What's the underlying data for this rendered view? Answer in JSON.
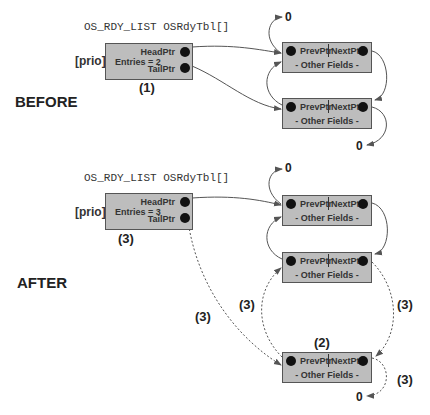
{
  "before": {
    "stage_label": "BEFORE",
    "table_title": "OS_RDY_LIST OSRdyTbl[]",
    "index_label": "[prio]",
    "list_head": {
      "entries_label": "Entries = 2",
      "head_ptr_label": "HeadPtr",
      "tail_ptr_label": "TailPtr"
    },
    "step_label": "(1)",
    "nodes": [
      {
        "prev_label": "PrevPtr",
        "next_label": "NextPtr",
        "other_label": "- Other Fields -"
      },
      {
        "prev_label": "PrevPtr",
        "next_label": "NextPtr",
        "other_label": "- Other Fields -"
      }
    ],
    "null_top": "0",
    "null_bottom": "0"
  },
  "after": {
    "stage_label": "AFTER",
    "table_title": "OS_RDY_LIST OSRdyTbl[]",
    "index_label": "[prio]",
    "list_head": {
      "entries_label": "Entries = 3",
      "head_ptr_label": "HeadPtr",
      "tail_ptr_label": "TailPtr"
    },
    "step_head_label": "(3)",
    "nodes": [
      {
        "prev_label": "PrevPtr",
        "next_label": "NextPtr",
        "other_label": "- Other Fields -"
      },
      {
        "prev_label": "PrevPtr",
        "next_label": "NextPtr",
        "other_label": "- Other Fields -"
      },
      {
        "prev_label": "PrevPtr",
        "next_label": "NextPtr",
        "other_label": "- Other Fields -"
      }
    ],
    "new_node_step_label": "(2)",
    "step_tailptr_label": "(3)",
    "step_prev_label": "(3)",
    "step_next_label": "(3)",
    "step_null_label": "(3)",
    "null_top": "0",
    "null_bottom": "0"
  },
  "colors": {
    "box_fill": "#bdbdbd",
    "box_border": "#555555",
    "wire": "#555555",
    "dot": "#111111"
  }
}
